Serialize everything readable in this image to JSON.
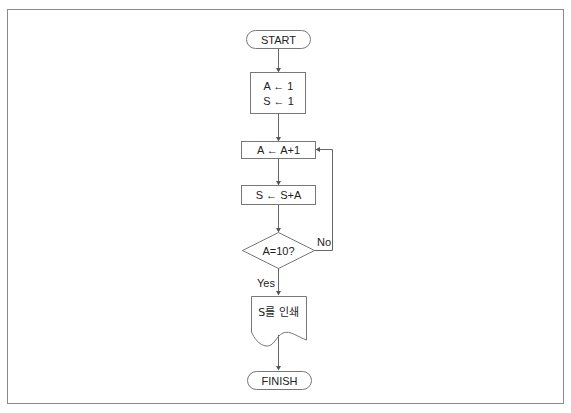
{
  "diagram": {
    "type": "flowchart",
    "colors": {
      "stroke": "#777777",
      "text": "#222222",
      "frame": "#8a8a8a",
      "background": "#ffffff"
    },
    "nodes": {
      "start": {
        "shape": "terminal",
        "label": "START"
      },
      "init": {
        "shape": "process",
        "lines": [
          "A ← 1",
          "S ← 1"
        ]
      },
      "increment": {
        "shape": "process",
        "label": "A ← A+1"
      },
      "accumulate": {
        "shape": "process",
        "label": "S ← S+A"
      },
      "decision": {
        "shape": "decision",
        "label": "A=10?"
      },
      "output": {
        "shape": "document",
        "label": "S를 인쇄"
      },
      "finish": {
        "shape": "terminal",
        "label": "FINISH"
      }
    },
    "edges": {
      "yes_label": "Yes",
      "no_label": "No"
    }
  }
}
